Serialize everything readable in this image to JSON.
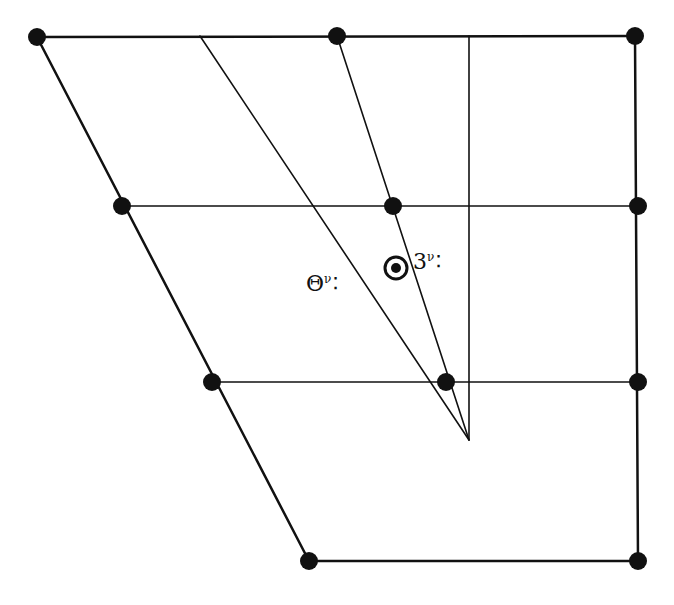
{
  "diagram": {
    "colors": {
      "stroke": "#111111",
      "background": "#ffffff"
    },
    "nodes": [
      {
        "id": "top-left",
        "x": 37,
        "y": 37
      },
      {
        "id": "top-mid",
        "x": 337,
        "y": 36
      },
      {
        "id": "top-right",
        "x": 635,
        "y": 36
      },
      {
        "id": "row2-left",
        "x": 122,
        "y": 206
      },
      {
        "id": "row2-mid",
        "x": 393,
        "y": 206
      },
      {
        "id": "row2-right",
        "x": 638,
        "y": 206
      },
      {
        "id": "row3-left",
        "x": 212,
        "y": 382
      },
      {
        "id": "row3-mid",
        "x": 446,
        "y": 382
      },
      {
        "id": "row3-right",
        "x": 638,
        "y": 382
      },
      {
        "id": "bottom-left",
        "x": 309,
        "y": 561
      },
      {
        "id": "bottom-right",
        "x": 638,
        "y": 561
      }
    ],
    "edges": [
      {
        "x1": 37,
        "y1": 37,
        "x2": 635,
        "y2": 36,
        "w": 2.5
      },
      {
        "x1": 37,
        "y1": 37,
        "x2": 309,
        "y2": 561,
        "w": 2.5
      },
      {
        "x1": 635,
        "y1": 36,
        "x2": 638,
        "y2": 561,
        "w": 2.5
      },
      {
        "x1": 309,
        "y1": 561,
        "x2": 638,
        "y2": 561,
        "w": 2.5
      },
      {
        "x1": 122,
        "y1": 206,
        "x2": 638,
        "y2": 206,
        "w": 1.6
      },
      {
        "x1": 212,
        "y1": 382,
        "x2": 638,
        "y2": 382,
        "w": 1.6
      },
      {
        "x1": 200,
        "y1": 36,
        "x2": 469,
        "y2": 440,
        "w": 1.6
      },
      {
        "x1": 337,
        "y1": 36,
        "x2": 469,
        "y2": 440,
        "w": 1.6
      },
      {
        "x1": 469,
        "y1": 36,
        "x2": 469,
        "y2": 440,
        "w": 1.6
      }
    ],
    "target_marker": {
      "x": 396,
      "y": 268,
      "r_outer": 11,
      "r_inner": 5
    },
    "labels": [
      {
        "id": "label-left",
        "main": "Θ",
        "sup": "ν",
        "dots": "⁚",
        "x": 306,
        "y": 273
      },
      {
        "id": "label-right",
        "main": "3",
        "sup": "ν",
        "dots": "⁚",
        "x": 413,
        "y": 251
      }
    ]
  }
}
